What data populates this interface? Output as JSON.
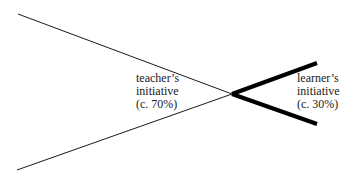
{
  "diagram": {
    "type": "initiative-crossing-lines",
    "teacher": {
      "lines": [
        "teacher’s",
        "initiative",
        "(c. 70%)"
      ],
      "percent_text": "c. 70%",
      "line_color": "#1a1a1a",
      "stroke_width": 1
    },
    "learner": {
      "lines": [
        "learner’s",
        "initiative",
        "(c. 30%)"
      ],
      "percent_text": "c. 30%",
      "line_color": "#000000",
      "stroke_width": 4
    }
  }
}
